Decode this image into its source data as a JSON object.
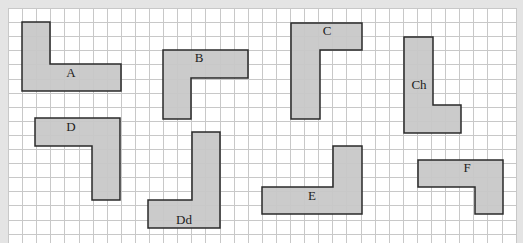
{
  "diagram": {
    "grid": {
      "origin_x": 8,
      "origin_y": 8,
      "cell": 14.1,
      "cols": 36,
      "rows": 17,
      "line_color": "#c8c8c8",
      "bg_color": "#ffffff",
      "frame_color": "#e4e4e4"
    },
    "shape_fill": "#c8c8c8",
    "shape_stroke": "#2a2a2a",
    "shapes": [
      {
        "label": "A",
        "points": "22,22 50,22 50,64 121,64 121,91 22,91",
        "label_x": 71,
        "label_y": 77
      },
      {
        "label": "B",
        "points": "163,50 248,50 248,78 191,78 191,119 163,119",
        "label_x": 199,
        "label_y": 62
      },
      {
        "label": "C",
        "points": "291,23 362,23 362,50 320,50 320,119 291,119",
        "label_x": 327,
        "label_y": 35
      },
      {
        "label": "Ch",
        "points": "404,37 433,37 433,105 461,105 461,133 404,133",
        "label_x": 419,
        "label_y": 89
      },
      {
        "label": "D",
        "points": "35,118 120,118 120,200 92,200 92,146 35,146",
        "label_x": 71,
        "label_y": 131
      },
      {
        "label": "Dd",
        "points": "192,132 220,132 220,228 148,228 148,200 192,200",
        "label_x": 184,
        "label_y": 224
      },
      {
        "label": "E",
        "points": "333,146 362,146 362,214 262,214 262,187 333,187",
        "label_x": 312,
        "label_y": 200
      },
      {
        "label": "F",
        "points": "418,160 503,160 503,214 475,214 475,187 418,187",
        "label_x": 467,
        "label_y": 172
      }
    ]
  }
}
